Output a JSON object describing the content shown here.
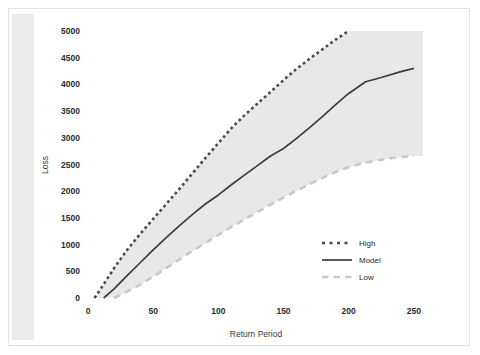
{
  "watermark": {
    "text": "GUY CARPENTER"
  },
  "chart_data": {
    "type": "line",
    "title": "",
    "xlabel": "Return Period",
    "ylabel": "Loss",
    "xlim": [
      0,
      257
    ],
    "ylim": [
      0,
      5000
    ],
    "xticks": [
      0,
      50,
      100,
      150,
      200,
      250
    ],
    "yticks": [
      0,
      500,
      1000,
      1500,
      2000,
      2500,
      3000,
      3500,
      4000,
      4500,
      5000
    ],
    "xtick_labels": [
      "0",
      "50",
      "100",
      "150",
      "200",
      "250"
    ],
    "ytick_labels": [
      "0",
      "500",
      "1000",
      "1500",
      "2000",
      "2500",
      "3000",
      "3500",
      "4000",
      "4500",
      "5000"
    ],
    "grid": false,
    "legend_position": "lower right",
    "band_fill": "#e8e8e8",
    "series": [
      {
        "name": "High",
        "style": "dotted",
        "color": "#4a4a4a",
        "x": [
          5,
          10,
          20,
          30,
          40,
          50,
          60,
          70,
          80,
          90,
          100,
          110,
          120,
          130,
          140,
          150,
          160,
          170,
          180,
          190,
          200
        ],
        "values": [
          0,
          180,
          560,
          900,
          1200,
          1480,
          1760,
          2040,
          2330,
          2620,
          2900,
          3180,
          3420,
          3640,
          3860,
          4080,
          4290,
          4480,
          4660,
          4840,
          5000
        ]
      },
      {
        "name": "Model",
        "style": "solid",
        "color": "#3d3d3d",
        "x": [
          12,
          20,
          30,
          40,
          50,
          60,
          70,
          80,
          90,
          100,
          110,
          120,
          130,
          140,
          150,
          160,
          170,
          180,
          190,
          200,
          213,
          225,
          240,
          250
        ],
        "values": [
          0,
          170,
          420,
          660,
          900,
          1130,
          1350,
          1560,
          1760,
          1930,
          2120,
          2300,
          2480,
          2660,
          2800,
          2990,
          3190,
          3400,
          3620,
          3830,
          4050,
          4130,
          4240,
          4300
        ]
      },
      {
        "name": "Low",
        "style": "dashed",
        "color": "#c9c9c9",
        "x": [
          20,
          30,
          40,
          50,
          60,
          70,
          80,
          90,
          100,
          110,
          120,
          130,
          140,
          150,
          160,
          170,
          180,
          190,
          200,
          210,
          220,
          230,
          240,
          250
        ],
        "values": [
          0,
          120,
          250,
          400,
          560,
          720,
          880,
          1030,
          1180,
          1330,
          1470,
          1610,
          1750,
          1880,
          2010,
          2130,
          2250,
          2360,
          2450,
          2520,
          2570,
          2610,
          2640,
          2660
        ]
      }
    ],
    "legend": [
      {
        "label": "High",
        "style": "dotted",
        "color": "#4a4a4a"
      },
      {
        "label": "Model",
        "style": "solid",
        "color": "#3d3d3d"
      },
      {
        "label": "Low",
        "style": "dashed",
        "color": "#c9c9c9"
      }
    ]
  }
}
